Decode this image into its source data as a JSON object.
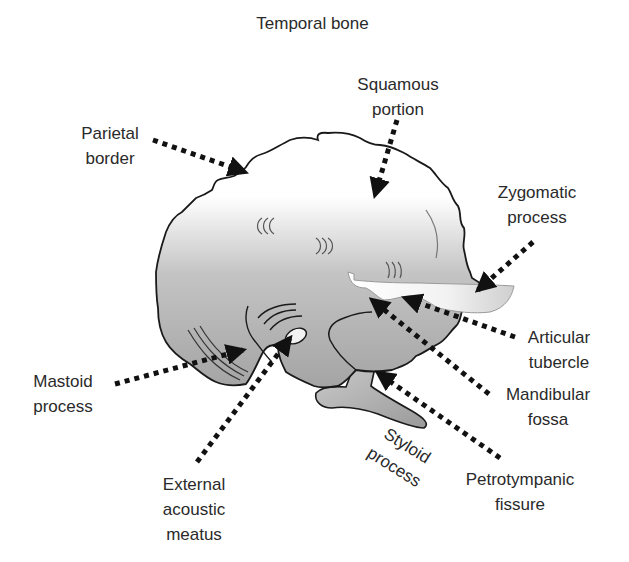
{
  "title": "Temporal bone",
  "labels": {
    "squamous": {
      "line1": "Squamous",
      "line2": "portion"
    },
    "parietal": {
      "line1": "Parietal",
      "line2": "border"
    },
    "zygomatic": {
      "line1": "Zygomatic",
      "line2": "process"
    },
    "articular": {
      "line1": "Articular",
      "line2": "tubercle"
    },
    "mandibular": {
      "line1": "Mandibular",
      "line2": "fossa"
    },
    "mastoid": {
      "line1": "Mastoid",
      "line2": "process"
    },
    "styloid": {
      "line1": "Styloid",
      "line2": "process"
    },
    "petrotympanic": {
      "line1": "Petrotympanic",
      "line2": "fissure"
    },
    "external": {
      "line1": "External",
      "line2": "acoustic",
      "line3": "meatus"
    }
  },
  "colors": {
    "outline": "#1a1a1a",
    "bone_fill_top": "#ffffff",
    "bone_fill_bottom": "#a9a9a9",
    "zygomatic_fill": "#efefef",
    "arrow": "#111111",
    "text": "#2a2a2a"
  }
}
